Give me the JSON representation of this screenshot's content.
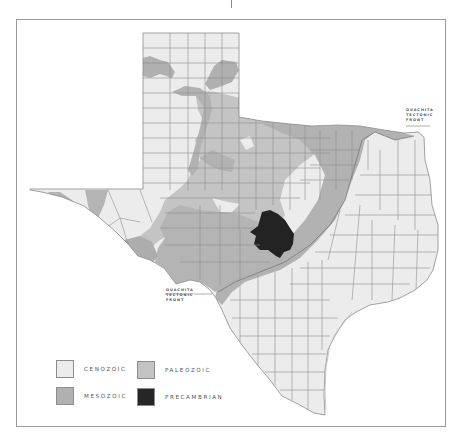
{
  "map": {
    "subject": "Texas",
    "colors": {
      "cenozoic": "#ececec",
      "mesozoic": "#b4b4b4",
      "paleozoic": "#c6c6c6",
      "precambrian": "#232323",
      "county_lines": "#8e8e8e",
      "frame": "#9a9a9a"
    }
  },
  "annotations": [
    {
      "id": "ouachita-front-ne",
      "lines": [
        "OUACHITA",
        "TECTONIC",
        "FRONT"
      ]
    },
    {
      "id": "ouachita-front-sw",
      "lines": [
        "OUACHITA",
        "TECTONIC",
        "FRONT"
      ]
    }
  ],
  "legend": {
    "items": [
      {
        "label": "CENOZOIC",
        "color": "#ececec"
      },
      {
        "label": "PALEOZOIC",
        "color": "#c3c3c3"
      },
      {
        "label": "MESOZOIC",
        "color": "#b0b0b0"
      },
      {
        "label": "PRECAMBRIAN",
        "color": "#262626"
      }
    ]
  }
}
